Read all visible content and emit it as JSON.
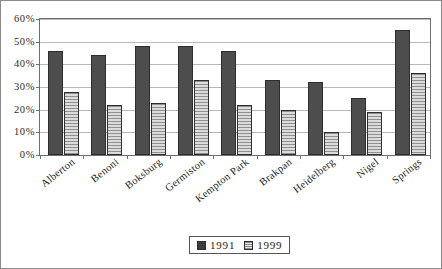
{
  "chart_data": {
    "type": "bar",
    "title": "",
    "subtitle": "",
    "xlabel": "",
    "ylabel": "",
    "ylim": [
      0,
      60
    ],
    "ytick_step": 10,
    "ytick_labels": [
      "60%",
      "50%",
      "40%",
      "30%",
      "20%",
      "10%",
      "0%"
    ],
    "ytick_values": [
      60,
      50,
      40,
      30,
      20,
      10,
      0
    ],
    "grid": true,
    "legend_position": "bottom-center",
    "categories": [
      "Alberton",
      "Benoni",
      "Boksburg",
      "Germiston",
      "Kempton Park",
      "Brakpan",
      "Heidelberg",
      "Nigel",
      "Springs"
    ],
    "series": [
      {
        "name": "1991",
        "color": "#4d4d4d",
        "values": [
          46,
          44,
          48,
          48,
          46,
          33,
          32,
          25,
          55
        ]
      },
      {
        "name": "1999",
        "color": "#c9c9c9",
        "values": [
          28,
          22,
          23,
          33,
          22,
          20,
          10,
          19,
          36
        ]
      }
    ]
  },
  "legend": {
    "entries": [
      {
        "label": "1991"
      },
      {
        "label": "1999"
      }
    ]
  },
  "colors": {
    "series_1991": "#4d4d4d",
    "series_1999": "#c9c9c9",
    "gridline": "#b9b9b9",
    "axis": "#6f6f6f",
    "frame_border": "#8a8a8a",
    "background": "#ffffff",
    "text": "#222222"
  }
}
